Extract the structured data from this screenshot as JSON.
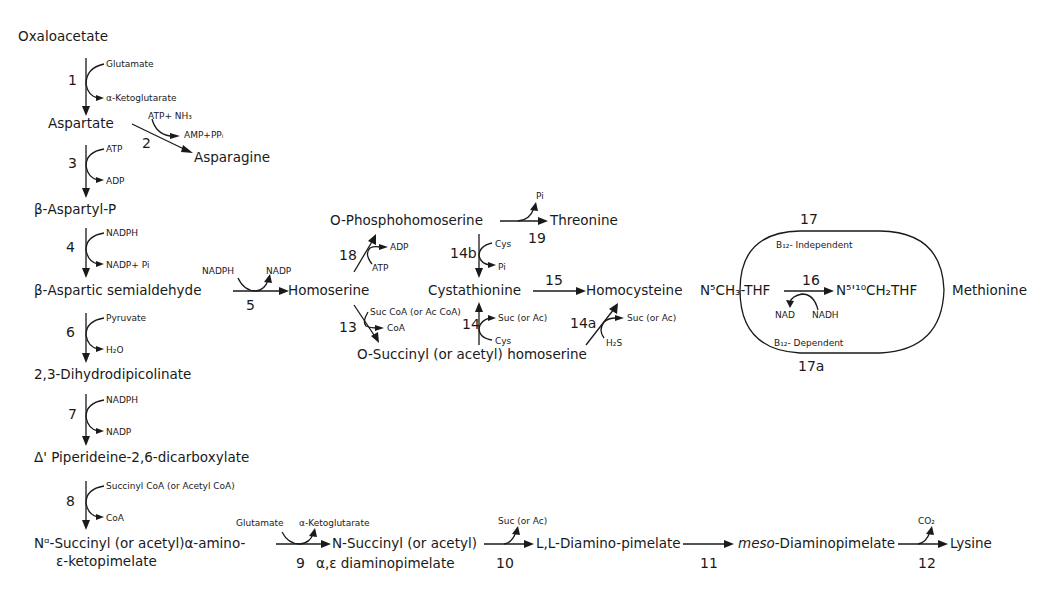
{
  "compounds": {
    "oxaloacetate": "Oxaloacetate",
    "aspartate": "Aspartate",
    "asparagine": "Asparagine",
    "aspartyl_p": "β-Aspartyl-P",
    "aspartic_semialdehyde": "β-Aspartic  semialdehyde",
    "homoserine": "Homoserine",
    "phosphohomoserine": "O-Phosphohomoserine",
    "threonine": "Threonine",
    "cystathionine": "Cystathionine",
    "homocysteine": "Homocysteine",
    "succinyl_homoserine": "O-Succinyl (or acetyl) homoserine",
    "n5_ch3_thf": "N⁵CH₃-THF",
    "n510_ch2_thf": "N⁵'¹⁰CH₂THF",
    "methionine": "Methionine",
    "dihydrodipicolinate": "2,3-Dihydrodipicolinate",
    "piperideine": "Δ' Piperideine-2,6-dicarboxylate",
    "succinyl_amino_ketopimelate_1": "Nᵅ-Succinyl (or acetyl)α-amino-",
    "succinyl_amino_ketopimelate_2": "ε-ketopimelate",
    "succinyl_diaminopimelate_1": "N-Succinyl (or acetyl)",
    "succinyl_diaminopimelate_2": "α,ε diaminopimelate",
    "ll_diaminopimelate": "L,L-Diamino-pimelate",
    "meso_prefix": "meso",
    "meso_diaminopimelate": "-Diaminopimelate",
    "lysine": "Lysine"
  },
  "cofactors": {
    "r1_in": "Glutamate",
    "r1_out": "α-Ketoglutarate",
    "r2_in": "ATP+ NH₃",
    "r2_out": "AMP+PPᵢ",
    "r3_in": "ATP",
    "r3_out": "ADP",
    "r4_in": "NADPH",
    "r4_out": "NADP+ Pi",
    "r5_in": "NADPH",
    "r5_out": "NADP",
    "r6_in": "Pyruvate",
    "r6_out": "H₂O",
    "r7_in": "NADPH",
    "r7_out": "NADP",
    "r8_in": "Succinyl CoA (or Acetyl CoA)",
    "r8_out": "CoA",
    "r9_in": "Glutamate",
    "r9_out": "α-Ketoglutarate",
    "r10_out": "Suc (or Ac)",
    "r12_out": "CO₂",
    "r13_in": "Suc CoA (or Ac CoA)",
    "r13_out": "CoA",
    "r14_in": "Cys",
    "r14_out": "Suc (or Ac)",
    "r14a_in": "H₂S",
    "r14a_out": "Suc (or Ac)",
    "r14b_in": "Cys",
    "r14b_out": "Pi",
    "r16_in": "NADH",
    "r16_out": "NAD",
    "r18_in": "ATP",
    "r18_out": "ADP",
    "r19_out": "Pi",
    "b12_independent": "B₁₂- Independent",
    "b12_dependent": "B₁₂- Dependent"
  },
  "reactions": {
    "r1": "1",
    "r2": "2",
    "r3": "3",
    "r4": "4",
    "r5": "5",
    "r6": "6",
    "r7": "7",
    "r8": "8",
    "r9": "9",
    "r10": "10",
    "r11": "11",
    "r12": "12",
    "r13": "13",
    "r14": "14",
    "r14a": "14a",
    "r14b": "14b",
    "r15": "15",
    "r16": "16",
    "r17": "17",
    "r17a": "17a",
    "r18": "18",
    "r19": "19"
  },
  "colors": {
    "ink": "#1a1a1a",
    "background": "#ffffff"
  }
}
